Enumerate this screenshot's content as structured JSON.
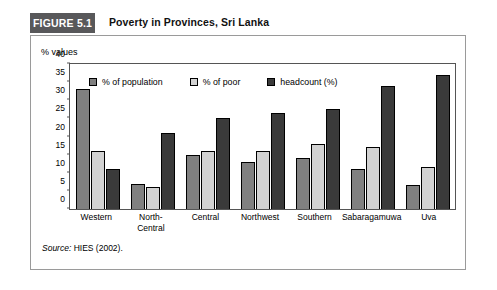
{
  "figure": {
    "number_label": "FIGURE 5.1",
    "title": "Poverty in Provinces, Sri Lanka",
    "source_label": "Source:",
    "source_text": " HIES (2002)."
  },
  "colors": {
    "population": "#808080",
    "poor": "#d2d2d2",
    "headcount": "#3a3a3a",
    "header_box": "#58585a",
    "panel_border": "#9a9a9a",
    "axis": "#555555"
  },
  "chart_data": {
    "type": "bar",
    "title": "Poverty in Provinces, Sri Lanka",
    "xlabel": "",
    "ylabel": "% values",
    "ylim": [
      0,
      40
    ],
    "yticks": [
      0,
      5,
      10,
      15,
      20,
      25,
      30,
      35,
      40
    ],
    "ytick_labels": [
      "0",
      "5",
      "10",
      "15",
      "20",
      "25",
      "30",
      "35",
      "40"
    ],
    "grid": false,
    "legend_position": "top-inside",
    "categories": [
      "Western",
      "North-\nCentral",
      "Central",
      "Northwest",
      "Southern",
      "Sabaragamuwa",
      "Uva"
    ],
    "series": [
      {
        "name": "% of population",
        "color": "#808080",
        "values": [
          33,
          7,
          15,
          13,
          14,
          11,
          6.5
        ]
      },
      {
        "name": "% of poor",
        "color": "#d2d2d2",
        "values": [
          16,
          6,
          16,
          16,
          18,
          17,
          11.5
        ]
      },
      {
        "name": "headcount (%)",
        "color": "#3a3a3a",
        "values": [
          11,
          21,
          25,
          26.5,
          27.5,
          34,
          37
        ]
      }
    ]
  }
}
